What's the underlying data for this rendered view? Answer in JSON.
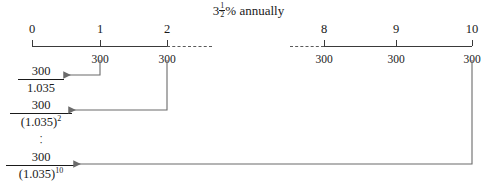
{
  "title": {
    "rate_whole": "3",
    "rate_frac_num": "1",
    "rate_frac_den": "2",
    "rate_suffix": "% annually"
  },
  "timeline": {
    "left_segment": {
      "period_labels": [
        "0",
        "1",
        "2"
      ],
      "payment_labels": [
        "300",
        "300"
      ]
    },
    "right_segment": {
      "period_labels": [
        "8",
        "9",
        "10"
      ],
      "payment_labels": [
        "300",
        "300",
        "300"
      ]
    }
  },
  "present_values": [
    {
      "numerator": "300",
      "denominator": "1.035",
      "exponent": ""
    },
    {
      "numerator": "300",
      "denominator": "(1.035)",
      "exponent": "2"
    },
    {
      "numerator": "300",
      "denominator": "(1.035)",
      "exponent": "10"
    }
  ],
  "vertical_dots": [
    "·",
    "·"
  ],
  "colors": {
    "ink": "#1a1a1a",
    "axis": "#3a3a3a",
    "connector": "#6b6b6b",
    "background": "#ffffff"
  }
}
